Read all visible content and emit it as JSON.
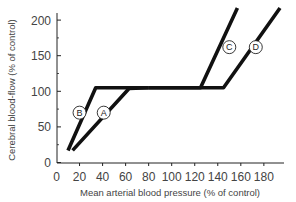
{
  "chart_data": {
    "type": "line",
    "title": "",
    "xlabel": "Mean arterial blood pressure (% of control)",
    "ylabel": "Cerebral blood-flow (% of control)",
    "xlim": [
      0,
      190
    ],
    "ylim": [
      0,
      215
    ],
    "xticks": [
      0,
      20,
      40,
      60,
      80,
      100,
      120,
      140,
      160,
      180
    ],
    "yticks": [
      0,
      50,
      100,
      150,
      200
    ],
    "grid": false,
    "legend": "inline circled labels",
    "series": [
      {
        "name": "A",
        "points": [
          [
            14,
            17
          ],
          [
            63,
            104
          ],
          [
            80,
            105
          ]
        ]
      },
      {
        "name": "B",
        "points": [
          [
            10,
            17
          ],
          [
            34,
            105
          ],
          [
            80,
            105
          ]
        ]
      },
      {
        "name": "C",
        "points": [
          [
            80,
            105
          ],
          [
            125,
            105
          ],
          [
            157,
            217
          ]
        ]
      },
      {
        "name": "D",
        "points": [
          [
            80,
            105
          ],
          [
            145,
            105
          ],
          [
            194,
            217
          ]
        ]
      }
    ],
    "annotations": [
      {
        "text": "A",
        "x": 41,
        "y": 70
      },
      {
        "text": "B",
        "x": 20,
        "y": 70
      },
      {
        "text": "C",
        "x": 150,
        "y": 162
      },
      {
        "text": "D",
        "x": 173,
        "y": 162
      }
    ]
  }
}
